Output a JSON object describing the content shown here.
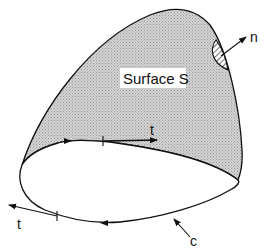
{
  "diagram": {
    "surface_label": "Surface S",
    "normal_label": "n",
    "tangent_top_label": "t",
    "tangent_bottom_label": "t",
    "curve_label": "c",
    "colors": {
      "surface_fill": "#c8c8c8",
      "stroke": "#111111",
      "background": "#ffffff"
    }
  }
}
